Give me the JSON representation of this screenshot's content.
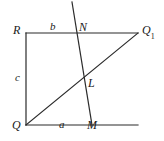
{
  "figure": {
    "kind": "geometry-diagram",
    "background_color": "#ffffff",
    "stroke_color": "#2b2b2b",
    "label_color": "#1a1a1a",
    "vertex_labels": {
      "R": "R",
      "N": "N",
      "Q1_base": "Q",
      "Q1_sub": "1",
      "L": "L",
      "Q": "Q",
      "M": "M"
    },
    "side_labels": {
      "b": "b",
      "c": "c",
      "a": "a"
    },
    "points": {
      "R": {
        "x": 26,
        "y": 33
      },
      "Q": {
        "x": 26,
        "y": 125
      },
      "Q1": {
        "x": 138,
        "y": 33
      },
      "M": {
        "x": 92,
        "y": 125
      },
      "N": {
        "x": 75,
        "y": 33
      },
      "L": {
        "x": 85,
        "y": 78
      },
      "top_extend": {
        "x": 72,
        "y": 2
      },
      "bottom_right_end": {
        "x": 138,
        "y": 125
      }
    },
    "segments": [
      {
        "name": "top-side-RQ1",
        "x1": 26,
        "y1": 33,
        "x2": 138,
        "y2": 33
      },
      {
        "name": "left-side-RQ",
        "x1": 26,
        "y1": 33,
        "x2": 26,
        "y2": 125
      },
      {
        "name": "bottom-side-QM-extended",
        "x1": 26,
        "y1": 125,
        "x2": 138,
        "y2": 125
      },
      {
        "name": "diagonal-Q-to-Q1",
        "x1": 26,
        "y1": 125,
        "x2": 138,
        "y2": 33
      },
      {
        "name": "transversal-N-to-M",
        "x1": 72,
        "y1": 2,
        "x2": 92,
        "y2": 125
      }
    ],
    "label_positions": {
      "R": {
        "x": 13,
        "y": 24
      },
      "b": {
        "x": 50,
        "y": 21
      },
      "N": {
        "x": 79,
        "y": 21
      },
      "Q1": {
        "x": 142,
        "y": 24
      },
      "c": {
        "x": 15,
        "y": 72
      },
      "L": {
        "x": 88,
        "y": 77
      },
      "Q": {
        "x": 12,
        "y": 119
      },
      "a": {
        "x": 59,
        "y": 119
      },
      "M": {
        "x": 87,
        "y": 119
      }
    }
  }
}
